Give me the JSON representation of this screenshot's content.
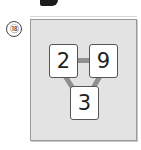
{
  "problem": {
    "number_label": "⑱",
    "cards": [
      {
        "id": "top-left",
        "value": "2"
      },
      {
        "id": "top-right",
        "value": "9"
      },
      {
        "id": "bottom",
        "value": "3"
      }
    ],
    "connections": [
      [
        "top-left",
        "top-right"
      ],
      [
        "top-left",
        "bottom"
      ],
      [
        "top-right",
        "bottom"
      ]
    ]
  },
  "colors": {
    "panel_bg": "#e3e3e3",
    "panel_border": "#9a9a9a",
    "card_bg": "#ffffff",
    "connector": "#8f8f8f"
  }
}
